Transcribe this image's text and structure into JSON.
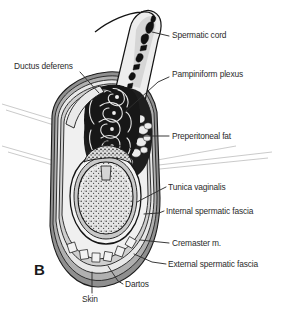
{
  "figure": {
    "panel_letter": "B",
    "background_color": "#ffffff",
    "text_color": "#2b2b2b",
    "colors": {
      "outline": "#141414",
      "skin_dartos_gray": "#8a8a8a",
      "mid_gray": "#b3b3b3",
      "light_gray": "#d8d8d8",
      "pale": "#efefef",
      "vessel_black": "#111111",
      "leader_line": "#3a3a3a",
      "faint_leader": "#b8b8b8"
    }
  },
  "labels": [
    {
      "id": "spermatic-cord",
      "text": "Spermatic cord",
      "x": 172,
      "y": 35,
      "align": "left"
    },
    {
      "id": "ductus-deferens",
      "text": "Ductus deferens",
      "x": 14,
      "y": 66,
      "align": "left"
    },
    {
      "id": "pampiniform-plexus",
      "text": "Pampiniform plexus",
      "x": 172,
      "y": 74,
      "align": "left"
    },
    {
      "id": "preperitoneal-fat",
      "text": "Preperitoneal fat",
      "x": 172,
      "y": 133,
      "align": "left"
    },
    {
      "id": "tunica-vaginalis",
      "text": "Tunica vaginalis",
      "x": 168,
      "y": 184,
      "align": "left"
    },
    {
      "id": "internal-spermatic-fascia",
      "text": "Internal spermatic fascia",
      "x": 166,
      "y": 208,
      "align": "left"
    },
    {
      "id": "cremaster-m",
      "text": "Cremaster m.",
      "x": 172,
      "y": 241,
      "align": "left"
    },
    {
      "id": "external-spermatic-fascia",
      "text": "External spermatic fascia",
      "x": 168,
      "y": 262,
      "align": "left"
    },
    {
      "id": "dartos",
      "text": "Dartos",
      "x": 125,
      "y": 283,
      "align": "left"
    },
    {
      "id": "skin",
      "text": "Skin",
      "x": 82,
      "y": 297,
      "align": "left"
    }
  ],
  "structures": [
    {
      "id": "spermatic-cord-structure",
      "name": "spermatic cord"
    },
    {
      "id": "ductus-deferens-structure",
      "name": "ductus deferens"
    },
    {
      "id": "pampiniform-plexus-structure",
      "name": "pampiniform plexus veins"
    },
    {
      "id": "preperitoneal-fat-structure",
      "name": "preperitoneal fat lobules"
    },
    {
      "id": "testis-structure",
      "name": "testis"
    },
    {
      "id": "epididymis-structure",
      "name": "epididymis"
    },
    {
      "id": "tunica-vaginalis-structure",
      "name": "tunica vaginalis"
    },
    {
      "id": "internal-spermatic-fascia-layer",
      "name": "internal spermatic fascia"
    },
    {
      "id": "cremaster-layer",
      "name": "cremaster muscle"
    },
    {
      "id": "external-spermatic-fascia-layer",
      "name": "external spermatic fascia"
    },
    {
      "id": "dartos-layer",
      "name": "dartos fascia"
    },
    {
      "id": "skin-layer",
      "name": "scrotal skin"
    }
  ]
}
